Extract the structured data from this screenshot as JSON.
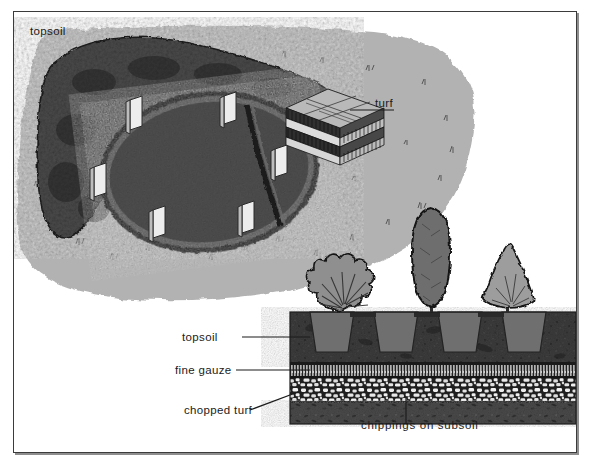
{
  "figure": {
    "frame": {
      "border_color": "#3b3b3b",
      "shadow_color": "#8e8e8e",
      "background": "#ffffff"
    }
  },
  "labels": {
    "topsoil_plan": "topsoil",
    "turf": "turf",
    "topsoil_section": "topsoil",
    "fine_gauze": "fine gauze",
    "chopped_turf": "chopped turf",
    "chippings_on_subsoil": "chippings on subsoil"
  },
  "plan_view": {
    "name": "plan-view-excavated-bed",
    "lawn_color": "#b2b2b2",
    "mound_color": "#4a4a4a",
    "excavation_color": "#565656",
    "marker_pegs": 6,
    "marker_peg_color": "#ececec",
    "elements": [
      "topsoil mound",
      "oval excavation",
      "diagonal trench",
      "marker pegs",
      "stacked turf squares",
      "lawn with grass tufts"
    ]
  },
  "cross_section": {
    "name": "soil-profile-cross-section",
    "layers": [
      {
        "id": "topsoil",
        "label": "topsoil",
        "color": "#3d3d3d",
        "pattern": "stippled-dark-soil"
      },
      {
        "id": "fine-gauze",
        "label": "fine gauze",
        "color": "#d2d2d2",
        "pattern": "vertical-hatch"
      },
      {
        "id": "chippings",
        "label": "chippings on subsoil",
        "color": "#2b2b2b",
        "pattern": "white-stone-aggregate"
      },
      {
        "id": "chopped-turf",
        "label": "chopped turf",
        "color": "#4b4b4b",
        "pattern": "mottled-dark"
      }
    ],
    "plants": [
      {
        "id": "plant-spreading-shrub",
        "shape": "spreading fan shrub",
        "color": "#8f8f8f",
        "position": "left"
      },
      {
        "id": "plant-columnar-conifer",
        "shape": "tall columnar conifer",
        "color": "#6e6e6e",
        "position": "center"
      },
      {
        "id": "plant-conical-shrub",
        "shape": "conical shrub",
        "color": "#9d9d9d",
        "position": "right"
      }
    ],
    "root_balls": 4
  }
}
